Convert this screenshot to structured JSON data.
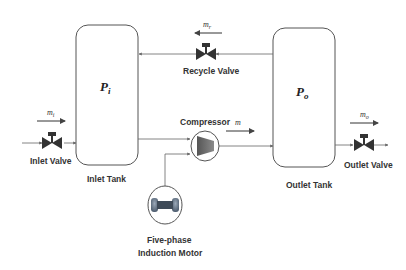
{
  "diagram": {
    "type": "process-flow",
    "inlet_tank": {
      "label": "Inlet Tank",
      "variable": "P",
      "subscript": "i"
    },
    "outlet_tank": {
      "label": "Outlet Tank",
      "variable": "P",
      "subscript": "o"
    },
    "inlet_valve": {
      "label": "Inlet Valve",
      "flow": "m",
      "flow_sub": "i"
    },
    "outlet_valve": {
      "label": "Outlet Valve",
      "flow": "m",
      "flow_sub": "o"
    },
    "recycle_valve": {
      "label": "Recycle Valve",
      "flow": "m",
      "flow_sub": "r"
    },
    "compressor": {
      "label": "Compressor",
      "flow": "m"
    },
    "motor": {
      "label_line1": "Five-phase",
      "label_line2": "Induction Motor"
    },
    "colors": {
      "line": "#555555",
      "valve": "#333333",
      "compressor": "#666666",
      "motor": "#6a7a8a"
    }
  }
}
